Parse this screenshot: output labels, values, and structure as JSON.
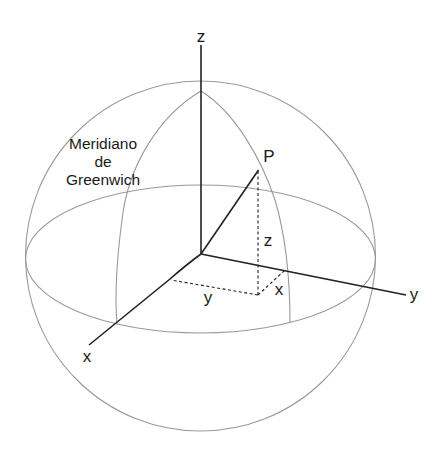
{
  "diagram": {
    "colors": {
      "sphere": "#9a9a9a",
      "axis": "#222222",
      "dashed": "#222222",
      "text": "#1a1a1a",
      "background": "#ffffff"
    },
    "labels": {
      "z_axis": "z",
      "y_axis": "y",
      "x_axis": "x",
      "point": "P",
      "z_component": "z",
      "y_component": "y",
      "x_component": "x",
      "meridian_line1": "Meridiano",
      "meridian_line2": "de",
      "meridian_line3": "Greenwich"
    }
  }
}
